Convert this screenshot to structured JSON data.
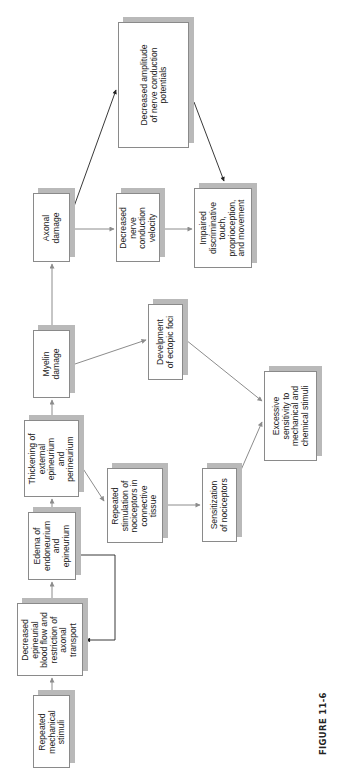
{
  "figure": {
    "caption": "FIGURE 11-6",
    "orientation": "rotated 90° counter-clockwise"
  },
  "colors": {
    "box_border": "#8a8a8a",
    "box_shadow": "#b9b9b9",
    "arrow_gray": "#8c8c8c",
    "arrow_black": "#222222"
  },
  "nodes": {
    "repeated_stimuli": {
      "label": "Repeated\nmechanical\nstimuli"
    },
    "decreased_blood_flow": {
      "label": "Decreased\nepineurial\nblood flow and\nrestriction of\naxonal\ntransport"
    },
    "edema": {
      "label": "Edema of\nendoneurium\nand\nepineurium"
    },
    "thickening": {
      "label": "Thickening of\nexternal\nepineurium\nand\nperineurium"
    },
    "myelin_damage": {
      "label": "Myelin\ndamage"
    },
    "axonal_damage": {
      "label": "Axonal\ndamage"
    },
    "decreased_amplitude": {
      "label": "Decreased amplitude\nof nerve conduction\npotentials"
    },
    "decreased_velocity": {
      "label": "Decreased\nnerve\nconduction\nvelocity"
    },
    "impaired_touch": {
      "label": "Impaired\ndiscriminative\ntouch,\nproprioception,\nand movement"
    },
    "ectopic_foci": {
      "label": "Develpment\nof ectopic foci"
    },
    "nociceptor_stimulation": {
      "label": "Repeated\nstimulation of\nnociceptors in\nconnective\ntissue"
    },
    "sensitization": {
      "label": "Sensitization\nof nociceptors"
    },
    "excessive_sensitivity": {
      "label": "Excessive\nsensitivity to\nmechanical and\nchemical stimuli"
    }
  },
  "edges": [
    {
      "from": "repeated_stimuli",
      "to": "decreased_blood_flow",
      "style": "gray"
    },
    {
      "from": "decreased_blood_flow",
      "to": "edema",
      "style": "gray"
    },
    {
      "from": "edema",
      "to": "decreased_blood_flow",
      "style": "black",
      "routing": "elbow feedback loop"
    },
    {
      "from": "edema",
      "to": "thickening",
      "style": "gray"
    },
    {
      "from": "thickening",
      "to": "myelin_damage",
      "style": "gray"
    },
    {
      "from": "thickening",
      "to": "nociceptor_stimulation",
      "style": "gray"
    },
    {
      "from": "myelin_damage",
      "to": "axonal_damage",
      "style": "gray"
    },
    {
      "from": "myelin_damage",
      "to": "ectopic_foci",
      "style": "gray"
    },
    {
      "from": "axonal_damage",
      "to": "decreased_amplitude",
      "style": "black"
    },
    {
      "from": "axonal_damage",
      "to": "decreased_velocity",
      "style": "gray"
    },
    {
      "from": "decreased_velocity",
      "to": "impaired_touch",
      "style": "gray"
    },
    {
      "from": "decreased_amplitude",
      "to": "impaired_touch",
      "style": "black"
    },
    {
      "from": "ectopic_foci",
      "to": "excessive_sensitivity",
      "style": "gray"
    },
    {
      "from": "nociceptor_stimulation",
      "to": "sensitization",
      "style": "gray"
    },
    {
      "from": "sensitization",
      "to": "excessive_sensitivity",
      "style": "gray"
    }
  ]
}
